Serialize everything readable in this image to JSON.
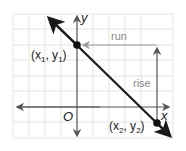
{
  "diagram": {
    "axes": {
      "x_label": "x",
      "y_label": "y",
      "origin_label": "O"
    },
    "points": [
      {
        "label_main": "(x",
        "sub1": "1",
        "mid": ", y",
        "sub2": "1",
        "end": ")"
      },
      {
        "label_main": "(x",
        "sub1": "2",
        "mid": ", y",
        "sub2": "2",
        "end": ")"
      }
    ],
    "annotations": {
      "run": "run",
      "rise": "rise"
    },
    "colors": {
      "grid": "#e4e4e4",
      "axis": "#555555",
      "line": "#1a1a1a",
      "annotation": "#8a8a8a",
      "rise_arrow": "#555555"
    }
  }
}
